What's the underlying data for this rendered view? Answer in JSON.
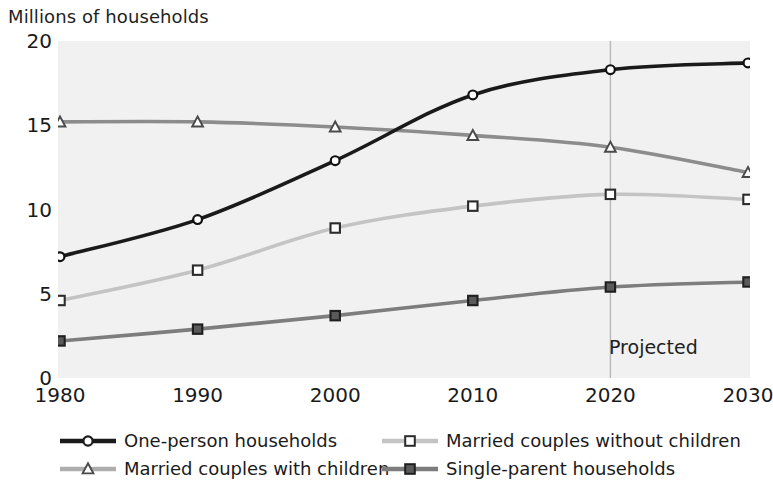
{
  "chart_data": {
    "type": "line",
    "title": "Millions of households",
    "xlabel": "",
    "ylabel": "Millions of households",
    "x": [
      1980,
      1990,
      2000,
      2010,
      2020,
      2030
    ],
    "categories": [
      "1980",
      "1990",
      "2000",
      "2010",
      "2020",
      "2030"
    ],
    "xlim": [
      1980,
      2030
    ],
    "ylim": [
      0,
      20
    ],
    "yticks": [
      0,
      5,
      10,
      15,
      20
    ],
    "ytick_labels": [
      "0",
      "5",
      "10",
      "15",
      "20"
    ],
    "xticks": [
      1980,
      1990,
      2000,
      2010,
      2020,
      2030
    ],
    "xtick_labels": [
      "1980",
      "1990",
      "2000",
      "2010",
      "2020",
      "2030"
    ],
    "grid": false,
    "legend_position": "bottom",
    "annotations": [
      {
        "text": "Projected",
        "x": 2020,
        "note": "vertical divider line at 2020 separating observed from projected data"
      }
    ],
    "series": [
      {
        "name": "One-person households",
        "marker": "circle-open",
        "color": "#1a1a1a",
        "values": [
          7.2,
          9.4,
          12.9,
          16.8,
          18.3,
          18.7
        ]
      },
      {
        "name": "Married couples with children",
        "marker": "triangle-open",
        "color": "#8c8c8c",
        "values": [
          15.2,
          15.2,
          14.9,
          14.4,
          13.7,
          12.2
        ]
      },
      {
        "name": "Married couples without children",
        "marker": "square-open",
        "color": "#c4c4c4",
        "values": [
          4.6,
          6.4,
          8.9,
          10.2,
          10.9,
          10.6
        ]
      },
      {
        "name": "Single-parent households",
        "marker": "square-filled",
        "color": "#7d7d7d",
        "values": [
          2.2,
          2.9,
          3.7,
          4.6,
          5.4,
          5.7
        ]
      }
    ]
  },
  "legend": {
    "items": [
      {
        "label": "One-person households",
        "marker": "circle-open",
        "color": "#1a1a1a"
      },
      {
        "label": "Married couples without children",
        "marker": "square-open",
        "color": "#c4c4c4"
      },
      {
        "label": "Married couples with children",
        "marker": "triangle-open",
        "color": "#8c8c8c"
      },
      {
        "label": "Single-parent households",
        "marker": "square-filled",
        "color": "#7d7d7d"
      }
    ]
  },
  "colors": {
    "plot_background": "#f1f1f1",
    "page_background": "#ffffff",
    "text": "#1a1a1a",
    "divider": "#b8b8b8"
  }
}
